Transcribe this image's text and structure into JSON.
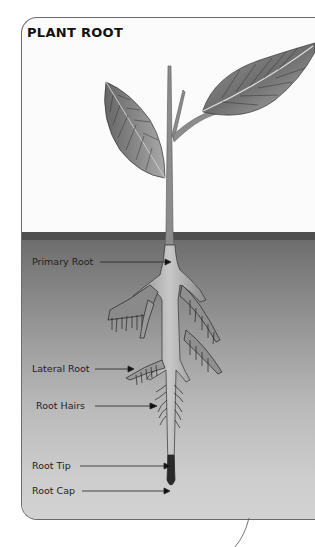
{
  "diagram": {
    "title": "PLANT ROOT",
    "labels": [
      {
        "id": "primary-root",
        "text": "Primary Root"
      },
      {
        "id": "lateral-root",
        "text": "Lateral Root"
      },
      {
        "id": "root-hairs",
        "text": "Root Hairs"
      },
      {
        "id": "root-tip",
        "text": "Root Tip"
      },
      {
        "id": "root-cap",
        "text": "Root Cap"
      }
    ],
    "colors": {
      "background": "#ffffff",
      "card": "#fbfbfb",
      "soil_top": "#6b6b6b",
      "soil_bottom": "#d2d2d2",
      "leaf": "#7a7a7a",
      "text": "#111111"
    }
  }
}
